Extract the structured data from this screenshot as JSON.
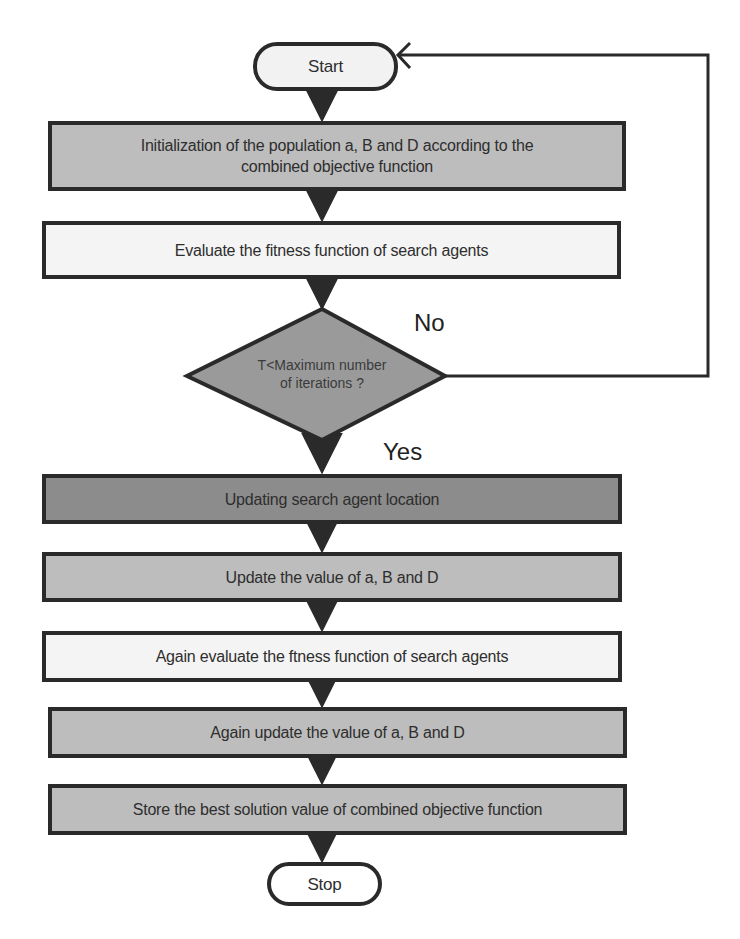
{
  "diagram": {
    "type": "flowchart",
    "colors": {
      "stroke": "#2a2a2a",
      "fill_light": "#f4f4f4",
      "fill_mid": "#bdbdbd",
      "fill_dark": "#8c8c8c",
      "diamond_fill": "#9a9a9a"
    },
    "nodes": {
      "start": {
        "label": "Start",
        "shape": "terminal"
      },
      "init": {
        "label": "Initialization of the population a, B and D according to the combined objective function",
        "line1": "Initialization of the population a, B and D according to the",
        "line2": "combined objective function",
        "shape": "process"
      },
      "evaluate": {
        "label": "Evaluate the fitness function of search agents",
        "shape": "process"
      },
      "decision": {
        "label": "T<Maximum number of iterations ?",
        "line1": "T<Maximum number",
        "line2": "of iterations ?",
        "shape": "decision"
      },
      "update_location": {
        "label": "Updating search agent location",
        "shape": "process"
      },
      "update_values": {
        "label": "Update the value of a, B and D",
        "shape": "process"
      },
      "again_evaluate": {
        "label": "Again evaluate the ftness function of search agents",
        "shape": "process"
      },
      "again_update": {
        "label": "Again update the value of a, B and D",
        "shape": "process"
      },
      "store_best": {
        "label": "Store the best solution value of combined objective function",
        "shape": "process"
      },
      "stop": {
        "label": "Stop",
        "shape": "terminal"
      }
    },
    "edge_labels": {
      "no": "No",
      "yes": "Yes"
    },
    "edges": [
      {
        "from": "start",
        "to": "init"
      },
      {
        "from": "init",
        "to": "evaluate"
      },
      {
        "from": "evaluate",
        "to": "decision"
      },
      {
        "from": "decision",
        "to": "start",
        "label": "No"
      },
      {
        "from": "decision",
        "to": "update_location",
        "label": "Yes"
      },
      {
        "from": "update_location",
        "to": "update_values"
      },
      {
        "from": "update_values",
        "to": "again_evaluate"
      },
      {
        "from": "again_evaluate",
        "to": "again_update"
      },
      {
        "from": "again_update",
        "to": "store_best"
      },
      {
        "from": "store_best",
        "to": "stop"
      }
    ]
  }
}
